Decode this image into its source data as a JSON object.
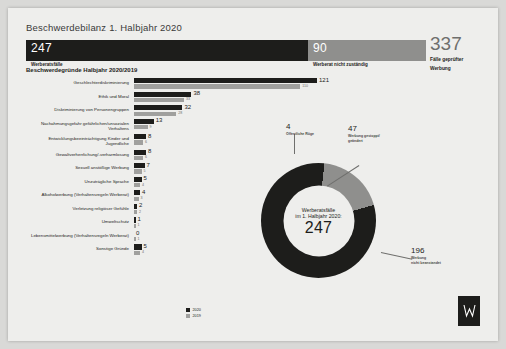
{
  "title": "Beschwerdebilanz 1. Halbjahr 2020",
  "summary_bar": {
    "segments": [
      {
        "value": "247",
        "caption": "Werberatsfälle"
      },
      {
        "value": "90",
        "caption": "Werberat nicht zuständig"
      }
    ],
    "total": {
      "value": "337",
      "caption_line1": "Fälle geprüfter",
      "caption_line2": "Werbung"
    }
  },
  "bar_chart_title": "Beschwerdegründe Halbjahr 2020/2019",
  "legend": [
    {
      "label": "2020",
      "color": "#1d1d1b"
    },
    {
      "label": "2019",
      "color": "#a0a09e"
    }
  ],
  "chart_data": {
    "type": "bar",
    "title": "Beschwerdegründe Halbjahr 2020/2019",
    "xlabel": "",
    "ylabel": "",
    "orientation": "horizontal",
    "categories": [
      "Geschlechterdiskriminierung",
      "Ethik und Moral",
      "Diskriminierung von Personengruppen",
      "Nachahmungsgefahr gefährlichen/unsozialen Verhaltens",
      "Entwicklungsbeeinträchtigung Kinder und Jugendliche",
      "Gewaltverherrlichung/-verharmlosung",
      "Sexuell anstößige Werbung",
      "Unzuträgliche Sprache",
      "Alkoholwerbung (Verhaltensregeln Werberat)",
      "Verletzung religiöser Gefühle",
      "Umweltschutz",
      "Lebensmittelwerbung (Verhaltensregeln Werberat)",
      "Sonstige Gründe"
    ],
    "series": [
      {
        "name": "2020",
        "color": "#1d1d1b",
        "values": [
          121,
          38,
          32,
          13,
          8,
          8,
          7,
          5,
          4,
          2,
          1,
          0,
          5
        ]
      },
      {
        "name": "2019",
        "color": "#a0a09e",
        "values": [
          110,
          33,
          28,
          9,
          6,
          6,
          5,
          4,
          3,
          2,
          1,
          1,
          4
        ]
      }
    ],
    "xlim": [
      0,
      121
    ],
    "grid": false,
    "legend_position": "bottom"
  },
  "donut": {
    "type": "pie",
    "center_line1": "Werberatsfälle",
    "center_line2": "im 1. Halbjahr 2020:",
    "center_value": "247",
    "slices": [
      {
        "label": "Öffentliche Rüge",
        "value": "4",
        "color": "#1d1d1b"
      },
      {
        "label_line1": "Werbung gestoppt/",
        "label_line2": "geändert",
        "value": "47",
        "color": "#8f8f8d"
      },
      {
        "label_line1": "Werbung",
        "label_line2": "nicht beanstandet",
        "value": "196",
        "color": "#1d1d1b"
      }
    ]
  },
  "logo": {
    "name": "werberat-logo"
  }
}
